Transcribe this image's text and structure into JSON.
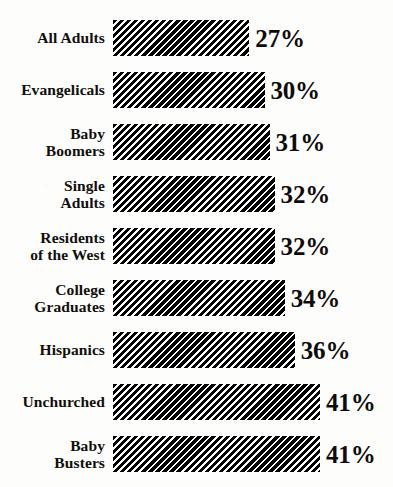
{
  "chart_data": {
    "type": "bar",
    "orientation": "horizontal",
    "title": "",
    "subtitle": "",
    "xlabel": "",
    "ylabel": "",
    "grid": false,
    "legend": "none",
    "xlim": [
      0,
      45
    ],
    "value_suffix": "%",
    "categories": [
      "All Adults",
      "Evangelicals",
      "Baby\nBoomers",
      "Single\nAdults",
      "Residents\nof the West",
      "College\nGraduates",
      "Hispanics",
      "Unchurched",
      "Baby\nBusters"
    ],
    "values": [
      27,
      30,
      31,
      32,
      32,
      34,
      36,
      41,
      41
    ],
    "value_labels": [
      "27%",
      "30%",
      "31%",
      "32%",
      "32%",
      "34%",
      "36%",
      "41%",
      "41%"
    ],
    "colors": {
      "bar_fill": "#000000",
      "bar_background": "#ffffff",
      "text": "#100f0d",
      "page_background": "#fdfdfb"
    },
    "bar_style": "diagonal-hatch"
  },
  "layout": {
    "bar_origin_x": 113,
    "px_per_unit": 5.05,
    "bar_height": 36,
    "row_pitch": 52,
    "first_row_top": 20
  }
}
